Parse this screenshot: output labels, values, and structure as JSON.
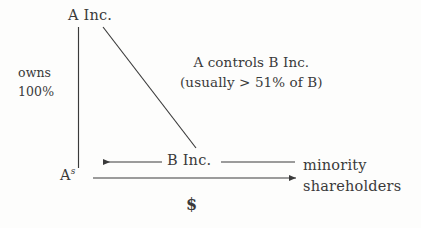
{
  "diagram": {
    "background_color": "#fdfdfc",
    "ink_color": "#3a3a3a",
    "nodes": {
      "parent": {
        "label": "A Inc."
      },
      "subsidiary_holder": {
        "label_main": "A",
        "label_sup": "s"
      },
      "controlled": {
        "label": "B Inc."
      },
      "outside_holders": {
        "line1": "minority",
        "line2": "shareholders"
      }
    },
    "edge_labels": {
      "ownership_line1": "owns",
      "ownership_line2": "100%",
      "control_note_line1": "A controls B Inc.",
      "control_note_line2": "(usually > 51% of B)",
      "payment": "$"
    }
  }
}
